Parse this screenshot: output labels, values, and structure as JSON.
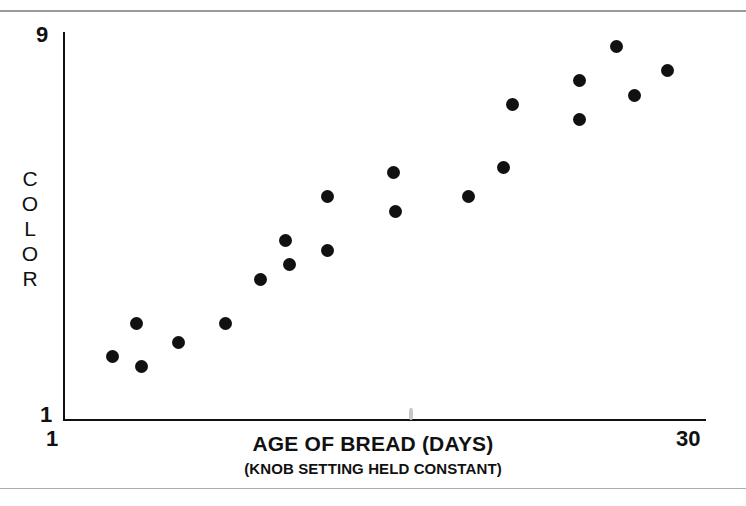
{
  "figure": {
    "background_color": "#ffffff",
    "ink_color": "#111111",
    "rule_color": "#9a9a9a",
    "ghost_watermark_top": "bleed-through",
    "ghost_watermark_mid": "bleed-through"
  },
  "axes": {
    "y_title_letters": [
      "C",
      "O",
      "L",
      "O",
      "R"
    ],
    "y_title": "COLOR",
    "y_tick_min": "1",
    "y_tick_max": "9",
    "x_title": "AGE OF BREAD (DAYS)",
    "x_subtitle": "(KNOB SETTING HELD CONSTANT)",
    "x_tick_min": "1",
    "x_tick_max": "30"
  },
  "chart_data": {
    "type": "scatter",
    "title": "",
    "xlabel": "AGE OF BREAD (DAYS)",
    "xlabel_note": "(KNOB SETTING HELD CONSTANT)",
    "ylabel": "COLOR",
    "xlim": [
      1,
      30
    ],
    "ylim": [
      1,
      9
    ],
    "xticks": [
      1,
      30
    ],
    "yticks": [
      1,
      9
    ],
    "grid": false,
    "legend": false,
    "marker": "filled-circle",
    "marker_color": "#111111",
    "marker_size_px": 13,
    "series": [
      {
        "name": "bread color",
        "points": [
          {
            "x": 3.2,
            "y": 2.3,
            "px": 113,
            "py": 357
          },
          {
            "x": 4.3,
            "y": 3.0,
            "px": 138,
            "py": 324
          },
          {
            "x": 4.5,
            "y": 2.1,
            "px": 142,
            "py": 368
          },
          {
            "x": 6.2,
            "y": 2.6,
            "px": 180,
            "py": 344
          },
          {
            "x": 8.3,
            "y": 3.0,
            "px": 225,
            "py": 324
          },
          {
            "x": 9.9,
            "y": 3.9,
            "px": 262,
            "py": 280
          },
          {
            "x": 11.0,
            "y": 4.7,
            "px": 285,
            "py": 240
          },
          {
            "x": 11.2,
            "y": 4.2,
            "px": 289,
            "py": 263
          },
          {
            "x": 12.9,
            "y": 4.5,
            "px": 328,
            "py": 246
          },
          {
            "x": 12.9,
            "y": 5.6,
            "px": 328,
            "py": 193
          },
          {
            "x": 15.9,
            "y": 6.1,
            "px": 395,
            "py": 171
          },
          {
            "x": 16.0,
            "y": 5.3,
            "px": 396,
            "py": 211
          },
          {
            "x": 19.3,
            "y": 5.6,
            "px": 468,
            "py": 197
          },
          {
            "x": 20.9,
            "y": 6.2,
            "px": 505,
            "py": 167
          },
          {
            "x": 21.3,
            "y": 7.5,
            "px": 512,
            "py": 103
          },
          {
            "x": 24.3,
            "y": 8.0,
            "px": 578,
            "py": 78
          },
          {
            "x": 24.3,
            "y": 7.2,
            "px": 579,
            "py": 118
          },
          {
            "x": 26.0,
            "y": 8.7,
            "px": 617,
            "py": 43
          },
          {
            "x": 26.8,
            "y": 7.7,
            "px": 634,
            "py": 94
          },
          {
            "x": 28.3,
            "y": 8.2,
            "px": 667,
            "py": 68
          }
        ]
      }
    ]
  }
}
